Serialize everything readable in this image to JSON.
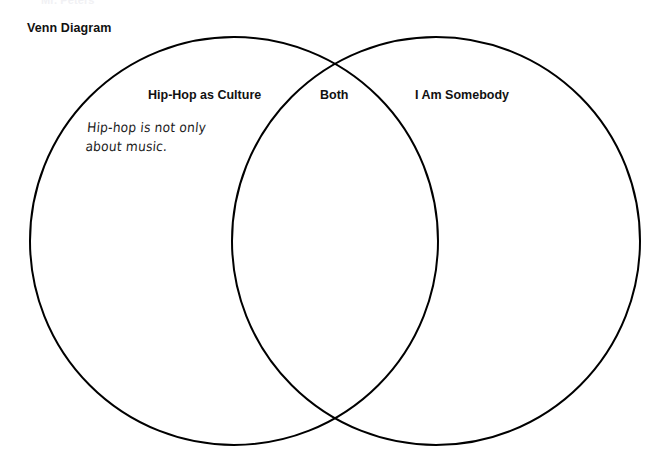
{
  "page": {
    "background_color": "#ffffff",
    "stroke_color": "#000000",
    "text_color": "#111111",
    "clipped_heading": "Mr. Peters",
    "title": "Venn Diagram"
  },
  "diagram": {
    "type": "venn",
    "set_count": 2,
    "left_circle": {
      "label": "Hip-Hop as Culture",
      "center_x": 234,
      "center_y": 241,
      "radius": 204,
      "note": "Hip-hop is not only\nabout music."
    },
    "right_circle": {
      "label": "I Am Somebody",
      "center_x": 436,
      "center_y": 241,
      "radius": 204,
      "note": ""
    },
    "intersection": {
      "label": "Both",
      "note": ""
    }
  }
}
